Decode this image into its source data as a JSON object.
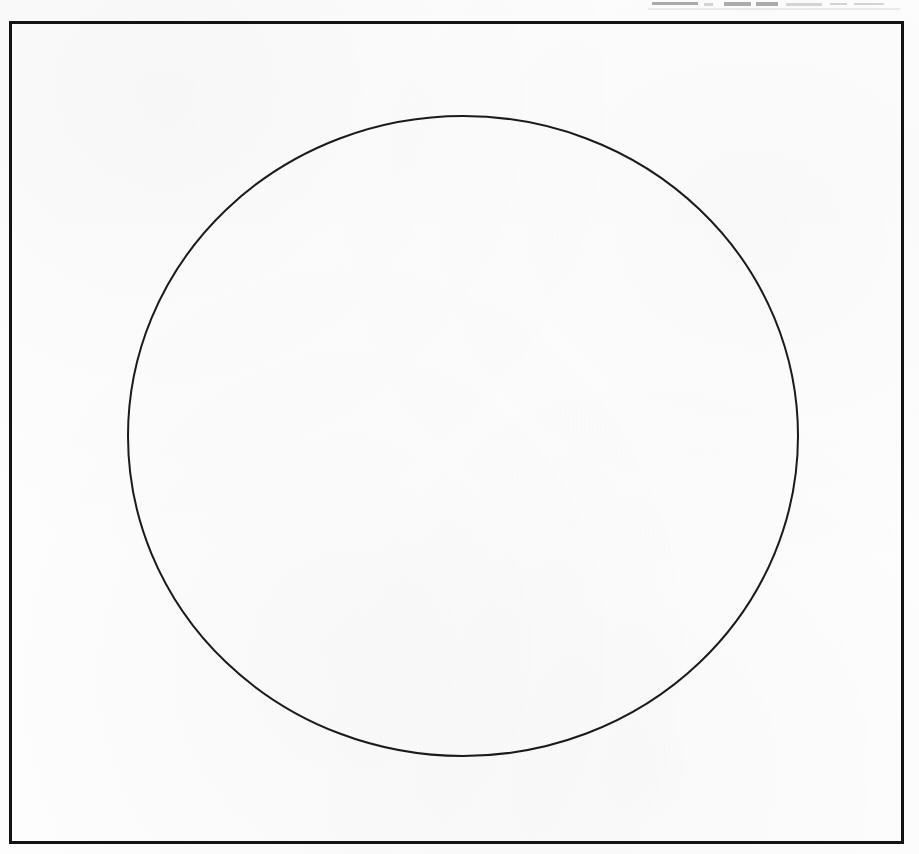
{
  "page": {
    "kind": "scanned-page",
    "width": 919,
    "height": 854,
    "paper_color": "#fefefe",
    "ink_color": "#131313"
  },
  "top_remnant": {
    "description": "faint cut-off remnants of a line of text above the figure",
    "legible": false,
    "text": ""
  },
  "figure": {
    "caption": "",
    "frame": {
      "name": "rectangular border",
      "left": 9,
      "top": 21,
      "width": 895,
      "height": 823,
      "stroke_width": 3,
      "stroke_color": "#131313",
      "fill": "none"
    },
    "shapes": [
      {
        "name": "circle",
        "type": "ellipse",
        "center_x": 463,
        "center_y": 436,
        "radius_x": 335,
        "radius_y": 320,
        "stroke_width": 2,
        "stroke_color": "#1a1a1a",
        "fill": "none",
        "left_extent": 128,
        "right_extent": 798,
        "top_extent": 116,
        "bottom_extent": 756
      }
    ]
  }
}
